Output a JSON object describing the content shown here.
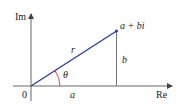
{
  "diagram": {
    "type": "complex-plane-polar",
    "axes": {
      "vertical_label": "Im",
      "horizontal_label": "Re",
      "origin_label": "0"
    },
    "point_label": "a + bi",
    "segments": {
      "modulus": "r",
      "real_part": "a",
      "imaginary_part": "b"
    },
    "angle_label": "θ",
    "colors": {
      "axes": "#555555",
      "vector": "#2b3f9e",
      "angle_arc": "#d23a4a",
      "text": "#1a1a1a"
    }
  }
}
